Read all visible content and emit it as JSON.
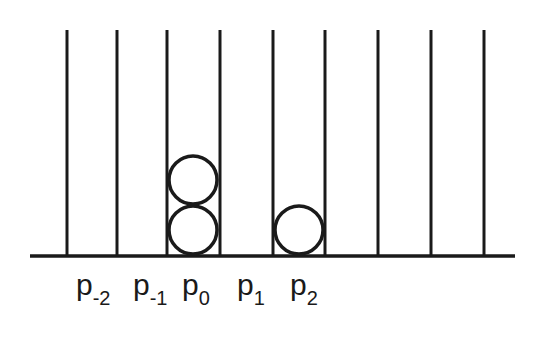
{
  "diagram": {
    "colors": {
      "line": "#1a1a1a",
      "background": "#ffffff"
    },
    "bin_lines_x": [
      67,
      117,
      167,
      220,
      273,
      325,
      378,
      431,
      484
    ],
    "line_top_y": 30,
    "baseline_y": 256,
    "baseline_x": [
      30,
      515
    ],
    "labels": [
      {
        "base": "p",
        "sub": "-2",
        "x": 76
      },
      {
        "base": "p",
        "sub": "-1",
        "x": 133
      },
      {
        "base": "p",
        "sub": "0",
        "x": 182
      },
      {
        "base": "p",
        "sub": "1",
        "x": 237
      },
      {
        "base": "p",
        "sub": "2",
        "x": 290
      }
    ],
    "balls": [
      {
        "bin": "p0",
        "cx": 193,
        "cy": 230,
        "r": 24
      },
      {
        "bin": "p0",
        "cx": 193,
        "cy": 180,
        "r": 24
      },
      {
        "bin": "p2",
        "cx": 299,
        "cy": 230,
        "r": 24
      }
    ]
  }
}
